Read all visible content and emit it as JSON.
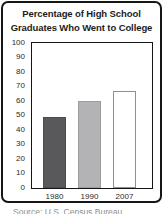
{
  "title": {
    "line1": "Percentage of High School",
    "line2": "Graduates Who Went to College"
  },
  "source": "Source: U.S. Census Bureau",
  "colors": {
    "card_border": "#161616",
    "plot_border": "#151515",
    "background": "#ffffff",
    "title_text": "#1c1c1c",
    "tick_text": "#2b2b2b",
    "source_text": "#8d8d8d"
  },
  "chart_data": {
    "type": "bar",
    "title": "Percentage of High School Graduates Who Went to College",
    "categories": [
      "1980",
      "1990",
      "2007"
    ],
    "values": [
      49,
      60,
      67
    ],
    "xlabel": "",
    "ylabel": "",
    "ylim": [
      0,
      100
    ],
    "ytick_step": 10,
    "ytick_labels": [
      "100",
      "90",
      "80",
      "70",
      "60",
      "50",
      "40",
      "30",
      "20",
      "10",
      "0"
    ],
    "grid": false,
    "legend": false,
    "bar_fill_colors": [
      "#59595b",
      "#b3b3b5",
      "#ffffff"
    ],
    "bar_border_colors": [
      "#4c4c4e",
      "#9d9d9f",
      "#8f8f91"
    ]
  }
}
